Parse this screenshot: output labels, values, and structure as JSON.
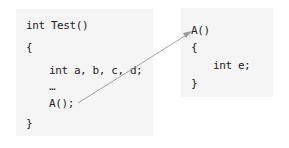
{
  "diagram": {
    "caller": {
      "lines": [
        "int Test()",
        "{",
        "int a, b, c, d;",
        "…",
        "A();",
        "}"
      ]
    },
    "callee": {
      "lines": [
        "A()",
        "{",
        "int e;",
        "}"
      ]
    },
    "arrow": {
      "from": "A();",
      "to": "A()",
      "color": "#9a9a9a"
    }
  }
}
